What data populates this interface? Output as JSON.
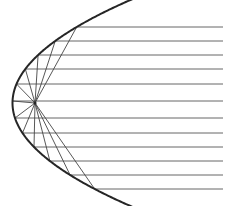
{
  "figure": {
    "background_color": "#ffffff",
    "width": 226,
    "height": 206
  },
  "diagram": {
    "type": "geometric-optics",
    "parabola": {
      "name": "parabolic-mirror-curve",
      "vertex": [
        12.5,
        103
      ],
      "opens": "right",
      "focus": [
        35,
        103
      ],
      "focal_length": 22.5,
      "stroke_color": "#262626",
      "stroke_width": 2.0,
      "upper_end": [
        152,
        2
      ],
      "lower_end": [
        146,
        197
      ]
    },
    "focus_point": {
      "name": "focus-point",
      "x": 35,
      "y": 103,
      "label": ""
    },
    "incoming_rays": {
      "name": "parallel-incoming-rays",
      "direction": "right-to-left",
      "stroke_color": "#555555",
      "stroke_width": 0.9,
      "x_end": 223,
      "count": 12,
      "y_values": [
        27,
        41,
        55,
        69,
        84,
        101,
        118,
        133,
        147,
        161,
        175,
        189
      ]
    },
    "reflected_rays": {
      "name": "reflected-rays-to-focus",
      "stroke_color": "#444444",
      "stroke_width": 0.9,
      "count": 12,
      "description": "Each horizontal ray strikes the parabola and reflects to the common focus"
    },
    "colors": {
      "curve": "#262626",
      "ray": "#555555",
      "reflected": "#444444",
      "background": "#ffffff"
    }
  }
}
